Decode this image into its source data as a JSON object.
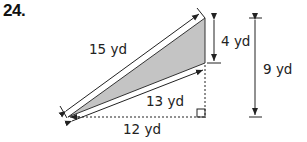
{
  "problem": {
    "number": "24."
  },
  "diagram": {
    "shape": "triangle",
    "fill_color": "#c4c4c4",
    "stroke_color": "#222222",
    "labels": {
      "hypotenuse_top": "15 yd",
      "lower_side": "13 yd",
      "base": "12 yd",
      "short_vertical": "4 yd",
      "total_height": "9 yd"
    },
    "right_angle_marker": true
  }
}
